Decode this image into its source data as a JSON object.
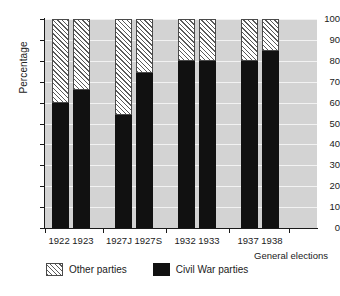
{
  "chart_data": {
    "type": "bar",
    "subtype": "stacked-100-percent",
    "title": "",
    "xlabel": "General elections",
    "ylabel": "Percentage",
    "categories": [
      "1922",
      "1923",
      "1927J",
      "1927S",
      "1932",
      "1933",
      "1937",
      "1938"
    ],
    "series": [
      {
        "name": "Civil War parties",
        "color": "#111111",
        "fill": "solid-black",
        "values": [
          60,
          66,
          54,
          74,
          80,
          80,
          80,
          84.5
        ]
      },
      {
        "name": "Other parties",
        "color": "#5a5a5a",
        "fill": "diagonal-hatch",
        "values": [
          40,
          34,
          46,
          26,
          20,
          20,
          20,
          15.5
        ]
      }
    ],
    "ylim": [
      0,
      100
    ],
    "yticks": [
      0,
      10,
      20,
      30,
      40,
      50,
      60,
      70,
      80,
      90,
      100
    ],
    "ytick_labels": [
      "0",
      "10",
      "20",
      "30",
      "40",
      "50",
      "60",
      "70",
      "80",
      "90",
      "100"
    ],
    "grid": true,
    "grid_color": "#f2f2f2",
    "plot_background": "#d3d3d3",
    "legend_position": "below-axes",
    "legend": [
      "Other parties",
      "Civil War parties"
    ],
    "category_groups": [
      [
        "1922",
        "1923"
      ],
      [
        "1927J",
        "1927S"
      ],
      [
        "1932",
        "1933"
      ],
      [
        "1937",
        "1938"
      ]
    ]
  },
  "axes": {
    "y_title": "Percentage",
    "x_title": "General elections"
  },
  "legend": {
    "other_label": "Other parties",
    "civil_label": "Civil War parties"
  }
}
